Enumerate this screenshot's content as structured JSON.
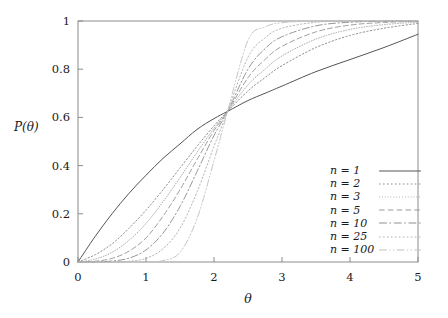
{
  "chart_data": {
    "type": "line",
    "title": "",
    "xlabel": "θ",
    "ylabel": "P(θ)",
    "xlim": [
      0,
      5
    ],
    "ylim": [
      0,
      1
    ],
    "xticks": [
      "0",
      "1",
      "2",
      "3",
      "4",
      "5"
    ],
    "yticks": [
      "0",
      "0.2",
      "0.4",
      "0.6",
      "0.8",
      "1"
    ],
    "xtick_values": [
      0,
      1,
      2,
      3,
      4,
      5
    ],
    "ytick_values": [
      0,
      0.2,
      0.4,
      0.6,
      0.8,
      1
    ],
    "grid": false,
    "legend_position": "lower right",
    "crossing_point": {
      "theta": 2.2,
      "P": 0.62
    },
    "x": [
      0,
      0.25,
      0.5,
      0.75,
      1,
      1.25,
      1.5,
      1.75,
      2,
      2.2,
      2.5,
      2.75,
      3,
      3.5,
      4,
      4.5,
      5
    ],
    "series": [
      {
        "name": "n = 1",
        "n": 1,
        "style": "solid",
        "color": "#555555",
        "values": [
          0,
          0.105,
          0.2,
          0.285,
          0.36,
          0.43,
          0.49,
          0.55,
          0.595,
          0.625,
          0.67,
          0.7,
          0.73,
          0.79,
          0.84,
          0.89,
          0.945
        ]
      },
      {
        "name": "n = 2",
        "n": 2,
        "style": "dotted",
        "color": "#8a8a8a",
        "values": [
          0,
          0.03,
          0.075,
          0.14,
          0.215,
          0.3,
          0.39,
          0.48,
          0.565,
          0.625,
          0.71,
          0.765,
          0.815,
          0.89,
          0.94,
          0.97,
          0.99
        ]
      },
      {
        "name": "n = 3",
        "n": 3,
        "style": "fine-dotted",
        "color": "#a8a8a8",
        "values": [
          0,
          0.012,
          0.04,
          0.09,
          0.16,
          0.25,
          0.35,
          0.455,
          0.555,
          0.625,
          0.735,
          0.8,
          0.855,
          0.925,
          0.965,
          0.985,
          0.995
        ]
      },
      {
        "name": "n = 5",
        "n": 5,
        "style": "dashed",
        "color": "#999999",
        "values": [
          0,
          0.003,
          0.015,
          0.045,
          0.1,
          0.19,
          0.3,
          0.425,
          0.545,
          0.625,
          0.765,
          0.84,
          0.895,
          0.955,
          0.983,
          0.994,
          0.999
        ]
      },
      {
        "name": "n = 10",
        "n": 10,
        "style": "dash-dot",
        "color": "#8f8f8f",
        "values": [
          0,
          0.0005,
          0.004,
          0.016,
          0.05,
          0.12,
          0.23,
          0.375,
          0.525,
          0.625,
          0.8,
          0.885,
          0.935,
          0.98,
          0.995,
          0.999,
          1.0
        ]
      },
      {
        "name": "n = 25",
        "n": 25,
        "style": "dotted",
        "color": "#b0b0b0",
        "values": [
          0,
          0.0,
          0.0004,
          0.003,
          0.015,
          0.055,
          0.14,
          0.29,
          0.48,
          0.625,
          0.85,
          0.93,
          0.97,
          0.995,
          0.999,
          1.0,
          1.0
        ]
      },
      {
        "name": "n = 100",
        "n": 100,
        "style": "dash-dot-dot",
        "color": "#c2c2c2",
        "values": [
          0,
          0.0,
          0.0,
          0.0,
          0.0004,
          0.006,
          0.04,
          0.18,
          0.42,
          0.625,
          0.92,
          0.975,
          0.993,
          0.9995,
          1.0,
          1.0,
          1.0
        ]
      }
    ]
  },
  "axes": {
    "ylabel": "P(θ)",
    "xlabel": "θ",
    "ytick_labels": [
      "1",
      "0.8",
      "0.6",
      "0.4",
      "0.2",
      "0"
    ],
    "xtick_labels": [
      "0",
      "1",
      "2",
      "3",
      "4",
      "5"
    ]
  },
  "legend": {
    "entries": [
      {
        "label": "n = 1"
      },
      {
        "label": "n = 2"
      },
      {
        "label": "n = 3"
      },
      {
        "label": "n = 5"
      },
      {
        "label": "n = 10"
      },
      {
        "label": "n = 25"
      },
      {
        "label": "n = 100"
      }
    ]
  },
  "colors": {
    "background": "#ffffff",
    "frame": "#8c8c8c",
    "text": "#1a1a1a"
  }
}
